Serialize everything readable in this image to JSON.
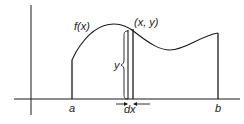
{
  "diagram": {
    "type": "area-under-curve-strip",
    "labels": {
      "function": "f(x)",
      "point": "(x, y)",
      "height": "y",
      "left_bound": "a",
      "right_bound": "b",
      "width": "dx"
    },
    "colors": {
      "stroke": "#1a1a1a",
      "background": "#ffffff"
    }
  }
}
